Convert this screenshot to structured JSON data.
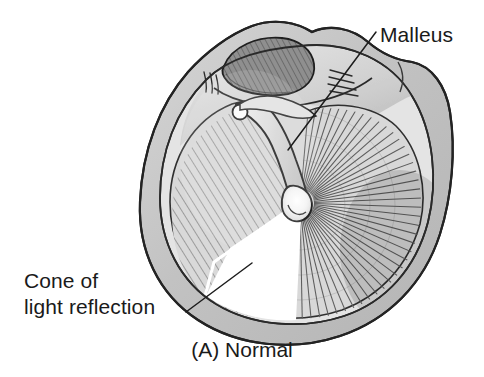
{
  "figure": {
    "type": "medical-illustration",
    "caption": "(A)  Normal",
    "caption_part_letter": "(A)",
    "caption_part_text": "Normal",
    "background_color": "#ffffff",
    "ink_color": "#1d1d1d"
  },
  "labels": {
    "malleus": {
      "text": "Malleus",
      "x": 380,
      "y": 42
    },
    "cone": {
      "line1": "Cone of",
      "line2": "light reflection",
      "x": 24,
      "y1": 288,
      "y2": 314
    },
    "caption": {
      "text": "(A)  Normal",
      "x": 242,
      "y": 357
    }
  },
  "leaders": [
    {
      "name": "malleus-leader",
      "from_x": 376,
      "from_y": 32,
      "to_x": 288,
      "to_y": 150
    },
    {
      "name": "cone-leader",
      "from_x": 186,
      "from_y": 312,
      "to_x": 252,
      "to_y": 263
    }
  ],
  "anatomy": {
    "annulus": {
      "name": "annulus-fibrosus-ring",
      "fill": "#c9c9c9"
    },
    "pars_tensa": {
      "name": "pars-tensa",
      "fill": "#d7d7d7"
    },
    "pars_flaccida": {
      "name": "pars-flaccida",
      "fill": "#8e8e8e"
    },
    "malleus_handle": {
      "name": "malleus-handle",
      "fill": "#e0e0e0"
    },
    "umbo": {
      "name": "umbo",
      "cx": 300,
      "cy": 203,
      "fill": "#f2f2f2"
    },
    "lateral_process": {
      "name": "lateral-process-knob",
      "cx": 240,
      "cy": 112,
      "r": 7,
      "fill": "#fbfbfb"
    },
    "cone_of_light": {
      "name": "cone-of-light-reflection",
      "fill": "#ffffff",
      "quadrant": "antero-inferior"
    }
  }
}
